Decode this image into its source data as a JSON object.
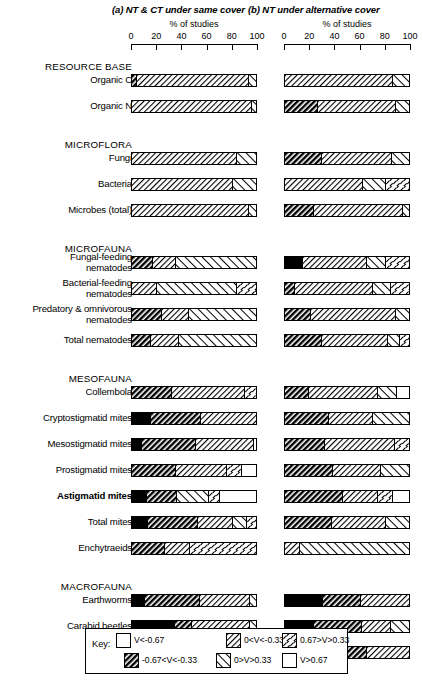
{
  "figure": {
    "panels": [
      {
        "id": "a",
        "title": "(a) NT & CT under same cover",
        "axis_unit": "% of studies"
      },
      {
        "id": "b",
        "title": "(b) NT under alternative cover",
        "axis_unit": "% of studies"
      }
    ],
    "tick_labels": [
      "0",
      "20",
      "40",
      "60",
      "80",
      "100"
    ],
    "axis_min": 0,
    "axis_max": 100
  },
  "legend": {
    "key_label": "Key:",
    "entries": [
      {
        "pattern": "solid-black",
        "label": "V<-0.67"
      },
      {
        "pattern": "dense-hatch-back",
        "label": "-0.67<V<-0.33"
      },
      {
        "pattern": "light-hatch-back",
        "label": "0<V<-0.33"
      },
      {
        "pattern": "sparse-hatch-fwd",
        "label": "0>V>0.33"
      },
      {
        "pattern": "dash-scatter",
        "label": "0.67>V>0.33"
      },
      {
        "pattern": "white",
        "label": "V>0.67"
      }
    ]
  },
  "chart_data": {
    "type": "bar",
    "orientation": "horizontal-stacked",
    "title": "",
    "xlabel": "% of studies",
    "ylabel": "",
    "xlim": [
      0,
      100
    ],
    "grid": false,
    "legend_position": "bottom",
    "categories_order": [
      "Organic C",
      "Organic N",
      "Fungi",
      "Bacteria",
      "Microbes (total)",
      "Fungal-feeding nematodes",
      "Bacterial-feeding nematodes",
      "Predatory & omnivorous nematodes",
      "Total nematodes",
      "Collembola",
      "Cryptostigmatid mites",
      "Mesostigmatid mites",
      "Prostigmatid mites",
      "Astigmatid mites",
      "Total mites",
      "Enchytraeids",
      "Earthworms",
      "Carabid beetles",
      "Spiders"
    ],
    "series_keys": [
      "solid-black",
      "dense-hatch-back",
      "light-hatch-back",
      "sparse-hatch-fwd",
      "dash-scatter",
      "white"
    ],
    "groups": [
      {
        "group": "RESOURCE BASE",
        "rows": [
          {
            "label": "Organic C",
            "bold": false,
            "a": [
              {
                "p": "dense-hatch-back",
                "v": 4
              },
              {
                "p": "light-hatch-back",
                "v": 89
              },
              {
                "p": "sparse-hatch-fwd",
                "v": 7
              }
            ],
            "b": [
              {
                "p": "light-hatch-back",
                "v": 86
              },
              {
                "p": "sparse-hatch-fwd",
                "v": 14
              }
            ]
          },
          {
            "label": "Organic N",
            "bold": false,
            "a": [
              {
                "p": "light-hatch-back",
                "v": 95
              },
              {
                "p": "sparse-hatch-fwd",
                "v": 5
              }
            ],
            "b": [
              {
                "p": "dense-hatch-back",
                "v": 26
              },
              {
                "p": "light-hatch-back",
                "v": 62
              },
              {
                "p": "sparse-hatch-fwd",
                "v": 12
              }
            ]
          }
        ]
      },
      {
        "group": "MICROFLORA",
        "rows": [
          {
            "label": "Fungi",
            "bold": false,
            "a": [
              {
                "p": "light-hatch-back",
                "v": 83
              },
              {
                "p": "sparse-hatch-fwd",
                "v": 17
              }
            ],
            "b": [
              {
                "p": "dense-hatch-back",
                "v": 29
              },
              {
                "p": "light-hatch-back",
                "v": 56
              },
              {
                "p": "sparse-hatch-fwd",
                "v": 15
              }
            ]
          },
          {
            "label": "Bacteria",
            "bold": false,
            "a": [
              {
                "p": "light-hatch-back",
                "v": 80
              },
              {
                "p": "sparse-hatch-fwd",
                "v": 20
              }
            ],
            "b": [
              {
                "p": "light-hatch-back",
                "v": 62
              },
              {
                "p": "sparse-hatch-fwd",
                "v": 18
              },
              {
                "p": "dash-scatter",
                "v": 20
              }
            ]
          },
          {
            "label": "Microbes (total)",
            "bold": false,
            "a": [
              {
                "p": "light-hatch-back",
                "v": 93
              },
              {
                "p": "sparse-hatch-fwd",
                "v": 7
              }
            ],
            "b": [
              {
                "p": "dense-hatch-back",
                "v": 23
              },
              {
                "p": "light-hatch-back",
                "v": 71
              },
              {
                "p": "sparse-hatch-fwd",
                "v": 6
              }
            ]
          }
        ]
      },
      {
        "group": "MICROFAUNA",
        "rows": [
          {
            "label": "Fungal-feeding\nnematodes",
            "bold": false,
            "a": [
              {
                "p": "dense-hatch-back",
                "v": 17
              },
              {
                "p": "light-hatch-back",
                "v": 18
              },
              {
                "p": "sparse-hatch-fwd",
                "v": 65
              }
            ],
            "b": [
              {
                "p": "solid-black",
                "v": 14
              },
              {
                "p": "light-hatch-back",
                "v": 51
              },
              {
                "p": "sparse-hatch-fwd",
                "v": 15
              },
              {
                "p": "dash-scatter",
                "v": 20
              }
            ]
          },
          {
            "label": "Bacterial-feeding\nnematodes",
            "bold": false,
            "a": [
              {
                "p": "light-hatch-back",
                "v": 20
              },
              {
                "p": "sparse-hatch-fwd",
                "v": 63
              },
              {
                "p": "dash-scatter",
                "v": 17
              }
            ],
            "b": [
              {
                "p": "dense-hatch-back",
                "v": 8
              },
              {
                "p": "light-hatch-back",
                "v": 62
              },
              {
                "p": "sparse-hatch-fwd",
                "v": 14
              },
              {
                "p": "dash-scatter",
                "v": 16
              }
            ]
          },
          {
            "label": "Predatory & omnivorous\nnematodes",
            "bold": false,
            "a": [
              {
                "p": "dense-hatch-back",
                "v": 24
              },
              {
                "p": "light-hatch-back",
                "v": 21
              },
              {
                "p": "sparse-hatch-fwd",
                "v": 55
              }
            ],
            "b": [
              {
                "p": "dense-hatch-back",
                "v": 21
              },
              {
                "p": "light-hatch-back",
                "v": 67
              },
              {
                "p": "sparse-hatch-fwd",
                "v": 12
              }
            ]
          },
          {
            "label": "Total nematodes",
            "bold": false,
            "a": [
              {
                "p": "dense-hatch-back",
                "v": 15
              },
              {
                "p": "light-hatch-back",
                "v": 22
              },
              {
                "p": "sparse-hatch-fwd",
                "v": 63
              }
            ],
            "b": [
              {
                "p": "dense-hatch-back",
                "v": 29
              },
              {
                "p": "light-hatch-back",
                "v": 53
              },
              {
                "p": "sparse-hatch-fwd",
                "v": 9
              },
              {
                "p": "dash-scatter",
                "v": 9
              }
            ]
          }
        ]
      },
      {
        "group": "MESOFAUNA",
        "rows": [
          {
            "label": "Collembola",
            "bold": false,
            "a": [
              {
                "p": "dense-hatch-back",
                "v": 32
              },
              {
                "p": "light-hatch-back",
                "v": 58
              },
              {
                "p": "dash-scatter",
                "v": 10
              }
            ],
            "b": [
              {
                "p": "dense-hatch-back",
                "v": 19
              },
              {
                "p": "light-hatch-back",
                "v": 55
              },
              {
                "p": "sparse-hatch-fwd",
                "v": 15
              },
              {
                "p": "white",
                "v": 11
              }
            ]
          },
          {
            "label": "Cryptostigmatid mites",
            "bold": false,
            "a": [
              {
                "p": "solid-black",
                "v": 15
              },
              {
                "p": "dense-hatch-back",
                "v": 40
              },
              {
                "p": "light-hatch-back",
                "v": 45
              }
            ],
            "b": [
              {
                "p": "dense-hatch-back",
                "v": 35
              },
              {
                "p": "light-hatch-back",
                "v": 35
              },
              {
                "p": "sparse-hatch-fwd",
                "v": 30
              }
            ]
          },
          {
            "label": "Mesostigmatid mites",
            "bold": false,
            "a": [
              {
                "p": "solid-black",
                "v": 8
              },
              {
                "p": "dense-hatch-back",
                "v": 43
              },
              {
                "p": "light-hatch-back",
                "v": 46
              },
              {
                "p": "white",
                "v": 3
              }
            ],
            "b": [
              {
                "p": "dense-hatch-back",
                "v": 32
              },
              {
                "p": "light-hatch-back",
                "v": 55
              },
              {
                "p": "dash-scatter",
                "v": 13
              }
            ]
          },
          {
            "label": "Prostigmatid mites",
            "bold": false,
            "a": [
              {
                "p": "dense-hatch-back",
                "v": 35
              },
              {
                "p": "light-hatch-back",
                "v": 40
              },
              {
                "p": "dash-scatter",
                "v": 12
              },
              {
                "p": "white",
                "v": 13
              }
            ],
            "b": [
              {
                "p": "dense-hatch-back",
                "v": 38
              },
              {
                "p": "light-hatch-back",
                "v": 38
              },
              {
                "p": "sparse-hatch-fwd",
                "v": 24
              }
            ]
          },
          {
            "label": "Astigmatid mites",
            "bold": true,
            "a": [
              {
                "p": "solid-black",
                "v": 12
              },
              {
                "p": "dense-hatch-back",
                "v": 24
              },
              {
                "p": "sparse-hatch-fwd",
                "v": 25
              },
              {
                "p": "dash-scatter",
                "v": 9
              },
              {
                "p": "white",
                "v": 30
              }
            ],
            "b": [
              {
                "p": "dense-hatch-back",
                "v": 46
              },
              {
                "p": "light-hatch-back",
                "v": 28
              },
              {
                "p": "dash-scatter",
                "v": 12
              },
              {
                "p": "white",
                "v": 14
              }
            ]
          },
          {
            "label": "Total mites",
            "bold": false,
            "a": [
              {
                "p": "solid-black",
                "v": 13
              },
              {
                "p": "dense-hatch-back",
                "v": 39
              },
              {
                "p": "light-hatch-back",
                "v": 28
              },
              {
                "p": "sparse-hatch-fwd",
                "v": 11
              },
              {
                "p": "dash-scatter",
                "v": 9
              }
            ],
            "b": [
              {
                "p": "dense-hatch-back",
                "v": 37
              },
              {
                "p": "light-hatch-back",
                "v": 43
              },
              {
                "p": "sparse-hatch-fwd",
                "v": 20
              }
            ]
          },
          {
            "label": "Enchytraeids",
            "bold": false,
            "a": [
              {
                "p": "dense-hatch-back",
                "v": 26
              },
              {
                "p": "light-hatch-back",
                "v": 20
              },
              {
                "p": "dash-scatter",
                "v": 54
              }
            ],
            "b": [
              {
                "p": "light-hatch-back",
                "v": 12
              },
              {
                "p": "sparse-hatch-fwd",
                "v": 88
              }
            ]
          }
        ]
      },
      {
        "group": "MACROFAUNA",
        "rows": [
          {
            "label": "Earthworms",
            "bold": false,
            "a": [
              {
                "p": "solid-black",
                "v": 10
              },
              {
                "p": "dense-hatch-back",
                "v": 44
              },
              {
                "p": "light-hatch-back",
                "v": 40
              },
              {
                "p": "sparse-hatch-fwd",
                "v": 6
              }
            ],
            "b": [
              {
                "p": "solid-black",
                "v": 30
              },
              {
                "p": "dense-hatch-back",
                "v": 30
              },
              {
                "p": "light-hatch-back",
                "v": 40
              }
            ]
          },
          {
            "label": "Carabid beetles",
            "bold": false,
            "a": [
              {
                "p": "solid-black",
                "v": 34
              },
              {
                "p": "dense-hatch-back",
                "v": 14
              },
              {
                "p": "light-hatch-back",
                "v": 46
              },
              {
                "p": "sparse-hatch-fwd",
                "v": 6
              }
            ],
            "b": [
              {
                "p": "solid-black",
                "v": 23
              },
              {
                "p": "dense-hatch-back",
                "v": 38
              },
              {
                "p": "light-hatch-back",
                "v": 23
              },
              {
                "p": "sparse-hatch-fwd",
                "v": 16
              }
            ]
          },
          {
            "label": "Spiders",
            "bold": false,
            "a": [
              {
                "p": "solid-black",
                "v": 26
              },
              {
                "p": "dense-hatch-back",
                "v": 16
              },
              {
                "p": "light-hatch-back",
                "v": 26
              },
              {
                "p": "sparse-hatch-fwd",
                "v": 32
              }
            ],
            "b": [
              {
                "p": "solid-black",
                "v": 30
              },
              {
                "p": "dense-hatch-back",
                "v": 35
              },
              {
                "p": "light-hatch-back",
                "v": 35
              }
            ]
          }
        ]
      }
    ]
  }
}
